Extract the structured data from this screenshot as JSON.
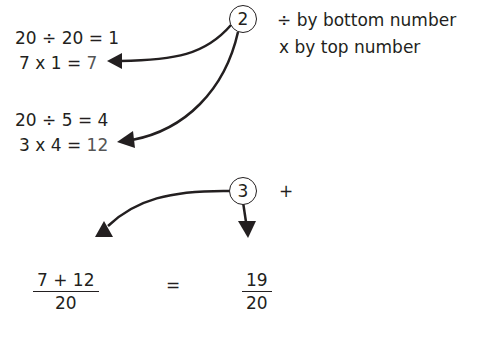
{
  "step2": {
    "marker": "2",
    "rule_divide": "÷  by bottom number",
    "rule_multiply": "x   by top number",
    "calc1_divide": "20 ÷ 20 = 1",
    "calc1_multiply_prefix": "7 x 1 = ",
    "calc1_result": "7",
    "calc2_divide": "20 ÷ 5 = 4",
    "calc2_multiply_prefix": "3 x 4 = ",
    "calc2_result": "12"
  },
  "step3": {
    "marker": "3",
    "operation": "+",
    "left_fraction": {
      "numerator": "7 + 12",
      "denominator": "20"
    },
    "equals": "=",
    "right_fraction": {
      "numerator": "19",
      "denominator": "20"
    }
  },
  "colors": {
    "ink": "#231f20",
    "result": "#555555"
  }
}
